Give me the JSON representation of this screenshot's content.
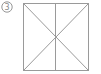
{
  "figure": {
    "label": "3",
    "stroke_color": "#9a9a9a",
    "square": {
      "x1": 23,
      "y1": 3,
      "x2": 88,
      "y2": 70
    },
    "lines": [
      "diagonal-top-left-to-bottom-right",
      "diagonal-top-right-to-bottom-left",
      "vertical-center"
    ]
  }
}
